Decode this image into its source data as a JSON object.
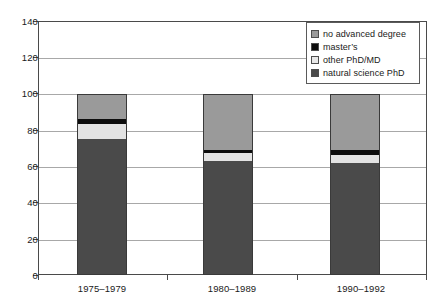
{
  "chart_data": {
    "type": "bar",
    "subtype": "stacked-bar-100",
    "title": "",
    "xlabel": "",
    "ylabel": "",
    "categories": [
      "1975–1979",
      "1980–1989",
      "1990–1992"
    ],
    "series": [
      {
        "name": "natural science PhD",
        "key": "natural",
        "color": "#4a4a4a",
        "values": [
          75,
          63,
          62
        ]
      },
      {
        "name": "other PhD/MD",
        "key": "otherphd",
        "color": "#e3e3e3",
        "values": [
          8,
          4,
          4
        ]
      },
      {
        "name": "master’s",
        "key": "masters",
        "color": "#0d0d0d",
        "values": [
          3,
          2,
          3
        ]
      },
      {
        "name": "no advanced degree",
        "key": "none",
        "color": "#9a9a9a",
        "values": [
          14,
          31,
          31
        ]
      }
    ],
    "stack_order": [
      "natural",
      "otherphd",
      "masters",
      "none"
    ],
    "totals": [
      100,
      100,
      100
    ],
    "ylim": [
      0,
      140
    ],
    "ytick_step": 20,
    "yticks": [
      0,
      20,
      40,
      60,
      80,
      100,
      120,
      140
    ],
    "ytick_labels": [
      "0",
      "20",
      "40",
      "60",
      "80",
      "100",
      "120",
      "140"
    ],
    "grid": true,
    "grid_axis": "y",
    "legend_position": "top-right",
    "legend_entries": [
      {
        "label": "no advanced degree",
        "color": "#9a9a9a"
      },
      {
        "label": "master’s",
        "color": "#0d0d0d"
      },
      {
        "label": "other PhD/MD",
        "color": "#e3e3e3"
      },
      {
        "label": "natural science PhD",
        "color": "#4a4a4a"
      }
    ]
  },
  "axes": {
    "y": {
      "labels": [
        "140",
        "120",
        "100",
        "80",
        "60",
        "40",
        "20",
        "0"
      ]
    },
    "x": {
      "labels": [
        "1975–1979",
        "1980–1989",
        "1990–1992"
      ]
    }
  },
  "legend": {
    "items": [
      {
        "label": "no advanced degree"
      },
      {
        "label": "master’s"
      },
      {
        "label": "other PhD/MD"
      },
      {
        "label": "natural science PhD"
      }
    ]
  }
}
